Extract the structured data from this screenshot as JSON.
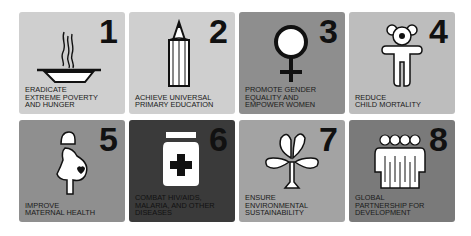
{
  "goals": [
    {
      "number": "1",
      "icon": "bowl-icon",
      "lines": [
        "ERADICATE",
        "EXTREME POVERTY",
        "AND HUNGER"
      ],
      "color": "#cfcfcf"
    },
    {
      "number": "2",
      "icon": "pencil-icon",
      "lines": [
        "ACHIEVE UNIVERSAL",
        "PRIMARY EDUCATION"
      ],
      "color": "#cfcfcf"
    },
    {
      "number": "3",
      "icon": "female-symbol-icon",
      "lines": [
        "PROMOTE GENDER",
        "EQUALITY AND",
        "EMPOWER WOMEN"
      ],
      "color": "#8e8e8e"
    },
    {
      "number": "4",
      "icon": "teddy-bear-icon",
      "lines": [
        "REDUCE",
        "CHILD MORTALITY"
      ],
      "color": "#bdbdbd"
    },
    {
      "number": "5",
      "icon": "pregnant-woman-icon",
      "lines": [
        "IMPROVE",
        "MATERNAL HEALTH"
      ],
      "color": "#8f8f8f"
    },
    {
      "number": "6",
      "icon": "medicine-jar-icon",
      "lines": [
        "COMBAT HIV/AIDS,",
        "MALARIA, AND OTHER",
        "DISEASES"
      ],
      "color": "#3a3a3a"
    },
    {
      "number": "7",
      "icon": "tree-icon",
      "lines": [
        "ENSURE",
        "ENVIRONMENTAL",
        "SUSTAINABILITY"
      ],
      "color": "#a3a3a3"
    },
    {
      "number": "8",
      "icon": "group-of-people-icon",
      "lines": [
        "GLOBAL",
        "PARTNERSHIP FOR",
        "DEVELOPMENT"
      ],
      "color": "#7a7a7a"
    }
  ]
}
